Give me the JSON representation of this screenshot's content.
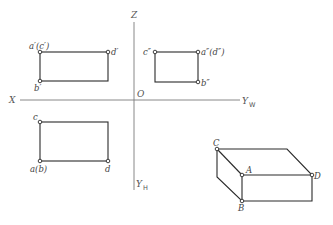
{
  "axes": {
    "z_label": "Z",
    "x_label": "X",
    "origin_label": "O",
    "yw_label": "Y",
    "yw_sub": "W",
    "yh_label": "Y",
    "yh_sub": "H"
  },
  "front_view": {
    "top_left": "a′(c′)",
    "top_right": "d′",
    "bottom_left": "b′"
  },
  "side_view": {
    "top_left": "c″",
    "top_right": "a″(d″)",
    "bottom_right": "b″"
  },
  "top_view": {
    "top_left": "c",
    "bottom_left": "a(b)",
    "bottom_right": "d"
  },
  "solid": {
    "C": "C",
    "A": "A",
    "D": "D",
    "B": "B"
  }
}
